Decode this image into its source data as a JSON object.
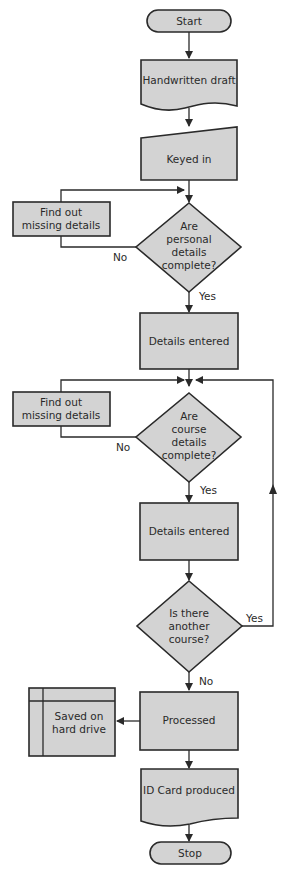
{
  "flowchart": {
    "start": "Start",
    "handwritten_draft": "Handwritten draft",
    "keyed_in": "Keyed in",
    "find_out_1": [
      "Find out",
      "missing details"
    ],
    "personal_decision": [
      "Are",
      "personal",
      "details",
      "complete?"
    ],
    "personal_no": "No",
    "personal_yes": "Yes",
    "details_entered_1": "Details entered",
    "find_out_2": [
      "Find out",
      "missing details"
    ],
    "course_decision": [
      "Are",
      "course",
      "details",
      "complete?"
    ],
    "course_no": "No",
    "course_yes": "Yes",
    "details_entered_2": "Details entered",
    "another_decision": [
      "Is there",
      "another",
      "course?"
    ],
    "another_yes": "Yes",
    "another_no": "No",
    "processed": "Processed",
    "saved": [
      "Saved on",
      "hard drive"
    ],
    "id_card": "ID Card produced",
    "stop": "Stop"
  },
  "colors": {
    "shape_fill": "#d3d3d3",
    "stroke": "#2a2a2a",
    "background": "#ffffff"
  }
}
